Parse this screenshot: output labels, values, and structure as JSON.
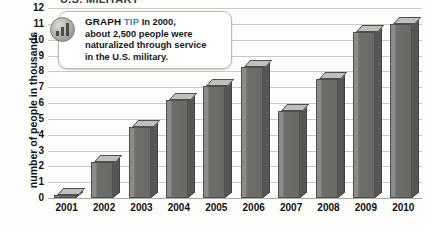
{
  "page": {
    "cropped_title": "U.S. MILITARY"
  },
  "axis": {
    "y_title": "number of people in thousands"
  },
  "tip": {
    "icon": "bar-chart-badge-icon",
    "heading": "GRAPH",
    "kicker": "TIP",
    "body": "In 2000, about 2,500 people were naturalized through service in the U.S. military.",
    "line1": "In 2000,",
    "line2": "about 2,500 people were",
    "line3": "naturalized through service",
    "line4": "in the U.S. military."
  },
  "colors": {
    "bar_front": "#6a6a67",
    "bar_highlight": "#8b8b88",
    "bar_side": "#565654",
    "bar_top": "#c9c9c5",
    "grid": "#c9c9c4",
    "tip_accent": "#4b7fb5"
  },
  "chart_data": {
    "type": "bar",
    "title": "U.S. MILITARY",
    "xlabel": "",
    "ylabel": "number of people in thousands",
    "categories": [
      "2001",
      "2002",
      "2003",
      "2004",
      "2005",
      "2006",
      "2007",
      "2008",
      "2009",
      "2010"
    ],
    "values": [
      0.2,
      2.3,
      4.5,
      6.2,
      7.1,
      8.3,
      5.5,
      7.5,
      10.5,
      11.0
    ],
    "ylim": [
      0,
      12
    ],
    "yticks": [
      0,
      1,
      2,
      3,
      4,
      5,
      6,
      7,
      8,
      9,
      10,
      11,
      12
    ],
    "ytick_labels": [
      "0",
      "1",
      "2",
      "3",
      "4",
      "5",
      "6",
      "7",
      "8",
      "9",
      "10",
      "11",
      "12"
    ],
    "grid": true,
    "legend": "none",
    "annotations": [
      "GRAPH TIP  In 2000, about 2,500 people were naturalized through service in the U.S. military."
    ]
  }
}
